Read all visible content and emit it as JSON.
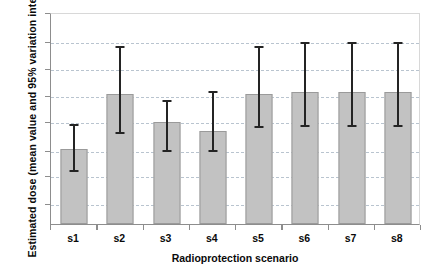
{
  "chart_data": {
    "type": "bar",
    "title": "",
    "xlabel": "Radioprotection scenario",
    "ylabel": "Estimated dose (mean value and 95% variation interval)",
    "categories": [
      "s1",
      "s2",
      "s3",
      "s4",
      "s5",
      "s6",
      "s7",
      "s8"
    ],
    "values": [
      0.354,
      0.613,
      0.481,
      0.439,
      0.613,
      0.623,
      0.623,
      0.623
    ],
    "error_low": [
      0.259,
      0.439,
      0.354,
      0.354,
      0.467,
      0.472,
      0.472,
      0.472
    ],
    "error_high": [
      0.476,
      0.844,
      0.59,
      0.632,
      0.844,
      0.863,
      0.863,
      0.863
    ],
    "ylim": [
      0,
      1
    ],
    "axis_tick_labels": [],
    "gridlines": [
      0.099,
      0.231,
      0.349,
      0.486,
      0.608,
      0.735,
      0.863
    ],
    "grid": true,
    "legend": null,
    "series": [
      {
        "name": "Estimated dose",
        "values": [
          0.354,
          0.613,
          0.481,
          0.439,
          0.613,
          0.623,
          0.623,
          0.623
        ]
      }
    ],
    "colors": {
      "bar_fill": "#c2c2c2",
      "bar_border": "#9a9a9a",
      "error_bar": "#242424",
      "gridline": "#b9c4cf",
      "axis": "#8d8d8d",
      "text": "#0a0a0a",
      "background": "#ffffff"
    }
  }
}
